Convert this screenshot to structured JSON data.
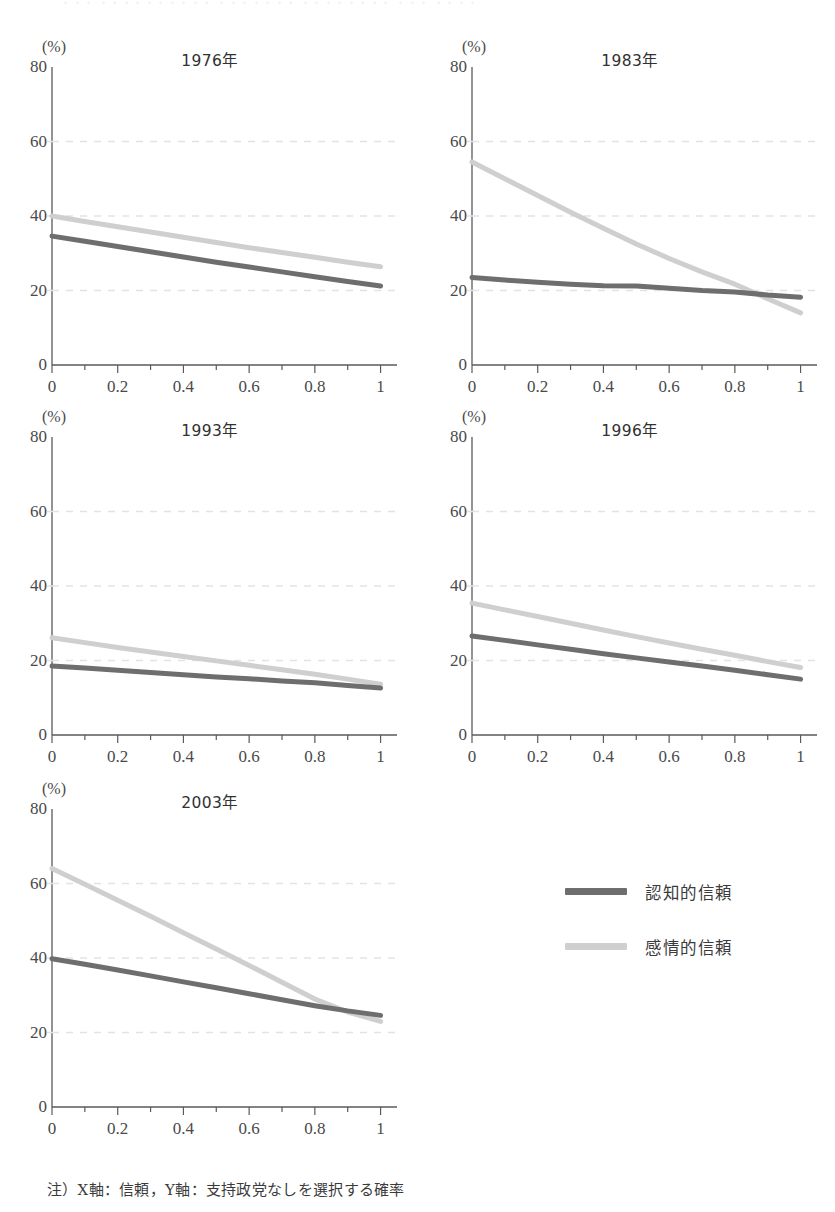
{
  "page": {
    "top_bleed_text": "・・・ ・・・・・・・・・・ ・・・・・・・ ・・・・・・・・ ・・・ ・・・・",
    "footnote": "注）X軸：信頼，Y軸：支持政党なしを選択する確率"
  },
  "axes": {
    "unit_label": "(%)",
    "y_ticks": [
      "0",
      "20",
      "40",
      "60",
      "80"
    ],
    "y_tick_values": [
      0,
      20,
      40,
      60,
      80
    ],
    "x_ticks": [
      "0",
      "0.2",
      "0.4",
      "0.6",
      "0.8",
      "1"
    ],
    "x_tick_values": [
      0,
      0.2,
      0.4,
      0.6,
      0.8,
      1
    ],
    "gridlines_at": [
      20,
      40,
      60
    ]
  },
  "colors": {
    "cognitive_trust": "#6e6e6e",
    "affective_trust": "#cfcfcf",
    "axis": "#5a5a5a",
    "gridline": "#e3e3e6",
    "text": "#3a3a3a"
  },
  "legend": {
    "position": "right-of-last-panel",
    "items": [
      {
        "label": "認知的信頼",
        "color": "#6e6e6e"
      },
      {
        "label": "感情的信頼",
        "color": "#cfcfcf"
      }
    ]
  },
  "chart_data": [
    {
      "type": "line",
      "title": "1976年",
      "xlabel": "",
      "ylabel": "(%)",
      "xlim": [
        0,
        1.05
      ],
      "ylim": [
        0,
        80
      ],
      "grid": true,
      "x": [
        0,
        0.1,
        0.2,
        0.3,
        0.4,
        0.5,
        0.6,
        0.7,
        0.8,
        0.9,
        1
      ],
      "series": [
        {
          "name": "認知的信頼",
          "color": "#6e6e6e",
          "values": [
            34.6,
            33.2,
            31.8,
            30.4,
            29.0,
            27.6,
            26.3,
            25.0,
            23.7,
            22.4,
            21.2
          ]
        },
        {
          "name": "感情的信頼",
          "color": "#cfcfcf",
          "values": [
            40.0,
            38.5,
            37.1,
            35.7,
            34.3,
            32.9,
            31.5,
            30.2,
            28.9,
            27.6,
            26.4
          ]
        }
      ]
    },
    {
      "type": "line",
      "title": "1983年",
      "xlabel": "",
      "ylabel": "(%)",
      "xlim": [
        0,
        1.05
      ],
      "ylim": [
        0,
        80
      ],
      "grid": true,
      "x": [
        0,
        0.1,
        0.2,
        0.3,
        0.4,
        0.5,
        0.6,
        0.7,
        0.8,
        0.9,
        1
      ],
      "series": [
        {
          "name": "認知的信頼",
          "color": "#6e6e6e",
          "values": [
            23.5,
            22.8,
            22.2,
            21.7,
            21.3,
            21.2,
            20.6,
            20.0,
            19.6,
            18.8,
            18.2
          ]
        },
        {
          "name": "感情的信頼",
          "color": "#cfcfcf",
          "values": [
            54.5,
            50.0,
            45.5,
            41.0,
            36.7,
            32.5,
            28.6,
            25.0,
            21.7,
            17.8,
            14.0
          ]
        }
      ]
    },
    {
      "type": "line",
      "title": "1993年",
      "xlabel": "",
      "ylabel": "(%)",
      "xlim": [
        0,
        1.05
      ],
      "ylim": [
        0,
        80
      ],
      "grid": true,
      "x": [
        0,
        0.1,
        0.2,
        0.3,
        0.4,
        0.5,
        0.6,
        0.7,
        0.8,
        0.9,
        1
      ],
      "series": [
        {
          "name": "認知的信頼",
          "color": "#6e6e6e",
          "values": [
            18.5,
            18.0,
            17.4,
            16.8,
            16.2,
            15.6,
            15.1,
            14.5,
            14.0,
            13.3,
            12.6
          ]
        },
        {
          "name": "感情的信頼",
          "color": "#cfcfcf",
          "values": [
            26.1,
            24.8,
            23.5,
            22.3,
            21.1,
            19.9,
            18.7,
            17.5,
            16.3,
            15.0,
            13.6
          ]
        }
      ]
    },
    {
      "type": "line",
      "title": "1996年",
      "xlabel": "",
      "ylabel": "(%)",
      "xlim": [
        0,
        1.05
      ],
      "ylim": [
        0,
        80
      ],
      "grid": true,
      "x": [
        0,
        0.1,
        0.2,
        0.3,
        0.4,
        0.5,
        0.6,
        0.7,
        0.8,
        0.9,
        1
      ],
      "series": [
        {
          "name": "認知的信頼",
          "color": "#6e6e6e",
          "values": [
            26.6,
            25.4,
            24.2,
            23.0,
            21.8,
            20.7,
            19.6,
            18.5,
            17.4,
            16.2,
            15.0
          ]
        },
        {
          "name": "感情的信頼",
          "color": "#cfcfcf",
          "values": [
            35.4,
            33.6,
            31.8,
            30.0,
            28.2,
            26.4,
            24.7,
            23.0,
            21.4,
            19.7,
            18.1
          ]
        }
      ]
    },
    {
      "type": "line",
      "title": "2003年",
      "xlabel": "",
      "ylabel": "(%)",
      "xlim": [
        0,
        1.05
      ],
      "ylim": [
        0,
        80
      ],
      "grid": true,
      "x": [
        0,
        0.1,
        0.2,
        0.3,
        0.4,
        0.5,
        0.6,
        0.7,
        0.8,
        0.9,
        1
      ],
      "series": [
        {
          "name": "認知的信頼",
          "color": "#6e6e6e",
          "values": [
            39.8,
            38.3,
            36.8,
            35.2,
            33.6,
            32.0,
            30.4,
            28.8,
            27.2,
            25.8,
            24.6
          ]
        },
        {
          "name": "感情的信頼",
          "color": "#cfcfcf",
          "values": [
            64.0,
            59.8,
            55.5,
            51.2,
            46.8,
            42.4,
            38.0,
            33.5,
            29.0,
            25.5,
            23.0
          ]
        }
      ]
    }
  ],
  "panel_positions": [
    {
      "left": 0,
      "top": 10
    },
    {
      "left": 420,
      "top": 10
    },
    {
      "left": 0,
      "top": 380
    },
    {
      "left": 420,
      "top": 380
    },
    {
      "left": 0,
      "top": 752
    }
  ]
}
